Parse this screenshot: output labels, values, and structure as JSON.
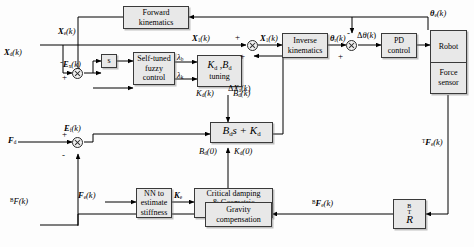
{
  "diagram": {
    "accent_block_fill": "#e8e8e8",
    "line_color": "#000000"
  },
  "blocks": [
    {
      "id": "forward-kinematics",
      "lines": [
        "Forward",
        "kinematics"
      ]
    },
    {
      "id": "s-derivative",
      "lines": [
        "s"
      ]
    },
    {
      "id": "self-tuned-fuzzy-control",
      "lines": [
        "Self-tuned",
        "fuzzy",
        "control"
      ]
    },
    {
      "id": "kd-bd-tuning",
      "lines": [
        "K",
        "tuning"
      ],
      "math": "Kd ,Bd"
    },
    {
      "id": "impedance-bds-kd",
      "lines": [
        "Bds + Kd"
      ]
    },
    {
      "id": "nn-estimate-stiffness",
      "lines": [
        "NN to",
        "estimate",
        "stiffness"
      ]
    },
    {
      "id": "critical-damping-geometric",
      "lines": [
        "Critical damping",
        "& Geometric",
        "representation"
      ]
    },
    {
      "id": "inverse-kinematics",
      "lines": [
        "Inverse",
        "kinematics"
      ]
    },
    {
      "id": "pd-control",
      "lines": [
        "PD",
        "control"
      ]
    },
    {
      "id": "robot-force-sensor",
      "lines": [
        "Robot",
        "Force sensor"
      ]
    },
    {
      "id": "gravity-compensation",
      "lines": [
        "Gravity",
        "compensation"
      ]
    },
    {
      "id": "rotation-matrix",
      "lines": [
        "R"
      ]
    }
  ],
  "labels": {
    "forward_kinematics_l1": "Forward",
    "forward_kinematics_l2": "kinematics",
    "s_block": "s",
    "fuzzy_l1": "Self-tuned",
    "fuzzy_l2": "fuzzy",
    "fuzzy_l3": "control",
    "tuning_l2": "tuning",
    "nn_l1": "NN to",
    "nn_l2": "estimate",
    "nn_l3": "stiffness",
    "critical_l1": "Critical damping",
    "critical_l2": "& Geometric",
    "critical_l3": "representation",
    "inverse_l1": "Inverse",
    "inverse_l2": "kinematics",
    "pd_l1": "PD",
    "pd_l2": "control",
    "robot": "Robot",
    "force_l1": "Force",
    "force_l2": "sensor",
    "gravity_l1": "Gravity",
    "gravity_l2": "compensation"
  },
  "signals": {
    "x_e": "Xe(k)",
    "x_d": "Xd(k)",
    "e_x": "Ex(k)",
    "lambda_b": "λb",
    "lambda_k": "λk",
    "kd_k": "Kd(k)",
    "bd_k": "Bd(k)",
    "bd_0": "Bd(0)",
    "kd_0": "Kd(0)",
    "x_1_left": "X1(k)",
    "x_1_right": "X1(k)",
    "delta_x_a": "ΔXa(k)",
    "theta_r": "θr(k)",
    "delta_theta": "Δθ(k)",
    "theta_e": "θe(k)",
    "t_f_e": "TFe(k)",
    "b_f_e": "BFe(k)",
    "b_f": "BF(k)",
    "f_d": "Fd",
    "f_e": "Fe(k)",
    "e_f": "Ef(k)",
    "k_e": "Ke"
  },
  "signs": {
    "plus": "+",
    "minus": "-"
  }
}
